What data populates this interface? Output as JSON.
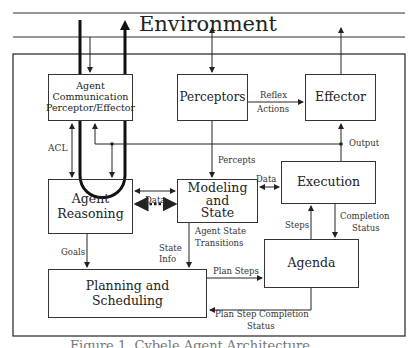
{
  "environment": {
    "title": "Environment"
  },
  "boxes": {
    "agent_comm": "Agent Communication Perceptor/Effector",
    "agent_comm_lines": [
      "Agent",
      "Communication",
      "Perceptor/Effector"
    ],
    "perceptors": "Perceptors",
    "effector": "Effector",
    "agent_reasoning_lines": [
      "Agent",
      "Reasoning"
    ],
    "modeling_lines": [
      "Modeling",
      "and",
      "State"
    ],
    "execution": "Execution",
    "agenda": "Agenda",
    "planning_lines": [
      "Planning and",
      "Scheduling"
    ]
  },
  "edges": {
    "acl": "ACL",
    "reflex": "Reflex",
    "actions": "Actions",
    "output": "Output",
    "percepts": "Percepts",
    "data_reasoning_modeling": "Data",
    "data_modeling_execution": "Data",
    "goals": "Goals",
    "state": "State",
    "info": "Info",
    "agent_state": "Agent State",
    "transitions": "Transitions",
    "steps": "Steps",
    "completion": "Completion",
    "status": "Status",
    "plan_steps": "Plan Steps",
    "plan_step_completion": "Plan Step Completion",
    "plan_status": "Status"
  },
  "caption": "Figure 1. Cybele Agent Architecture"
}
